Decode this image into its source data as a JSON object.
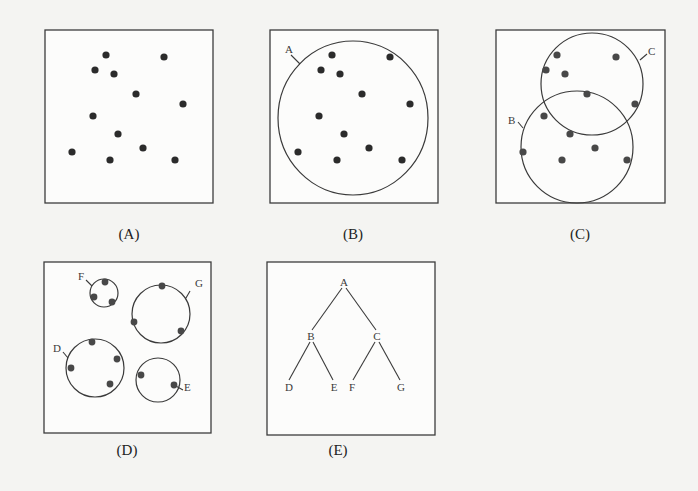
{
  "figure": {
    "panels": [
      {
        "id": "A",
        "caption": "(A)",
        "description": "Scatter of unclustered data points"
      },
      {
        "id": "B",
        "caption": "(B)",
        "description": "All points enclosed in a single cluster",
        "clusters": [
          {
            "label": "A"
          }
        ]
      },
      {
        "id": "C",
        "caption": "(C)",
        "description": "Points split into two overlapping clusters",
        "clusters": [
          {
            "label": "B"
          },
          {
            "label": "C"
          }
        ]
      },
      {
        "id": "D",
        "caption": "(D)",
        "description": "Points split into four smaller clusters",
        "clusters": [
          {
            "label": "F"
          },
          {
            "label": "G"
          },
          {
            "label": "D"
          },
          {
            "label": "E"
          }
        ]
      },
      {
        "id": "E",
        "caption": "(E)",
        "description": "Hierarchical clustering tree",
        "tree": {
          "nodes": [
            "A",
            "B",
            "C",
            "D",
            "E",
            "F",
            "G"
          ],
          "edges": [
            [
              "A",
              "B"
            ],
            [
              "A",
              "C"
            ],
            [
              "B",
              "D"
            ],
            [
              "B",
              "E"
            ],
            [
              "C",
              "F"
            ],
            [
              "C",
              "G"
            ]
          ]
        }
      }
    ]
  },
  "labels": {
    "b_cluster": "A",
    "c_cluster_1": "B",
    "c_cluster_2": "C",
    "d_cluster_f": "F",
    "d_cluster_g": "G",
    "d_cluster_d": "D",
    "d_cluster_e": "E",
    "tree_a": "A",
    "tree_b": "B",
    "tree_c": "C",
    "tree_d": "D",
    "tree_e": "E",
    "tree_f": "F",
    "tree_g": "G"
  },
  "captions": {
    "a": "(A)",
    "b": "(B)",
    "c": "(C)",
    "d": "(D)",
    "e": "(E)"
  }
}
